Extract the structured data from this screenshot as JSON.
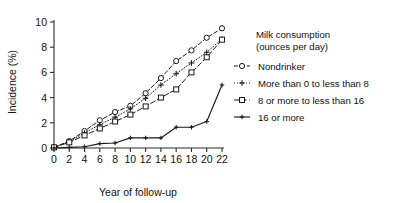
{
  "chart_data": {
    "type": "line",
    "title": "",
    "xlabel": "Year of follow-up",
    "ylabel": "Incidence (%)",
    "xlim": [
      0,
      22
    ],
    "ylim": [
      0,
      10
    ],
    "xticks": [
      0,
      2,
      4,
      6,
      8,
      10,
      12,
      14,
      16,
      18,
      20,
      22
    ],
    "yticks": [
      0,
      2,
      4,
      6,
      8,
      10
    ],
    "grid": false,
    "legend_position": "right",
    "legend_title_line1": "Milk consumption",
    "legend_title_line2": "(ounces per day)",
    "x": [
      0,
      2,
      4,
      6,
      8,
      10,
      12,
      14,
      16,
      18,
      20,
      22
    ],
    "series": [
      {
        "name": "Nondrinker",
        "values": [
          0.05,
          0.55,
          1.35,
          2.2,
          2.85,
          3.35,
          4.35,
          5.55,
          6.9,
          7.75,
          8.75,
          9.5
        ],
        "dash": "4,2.4",
        "marker": "circle-open",
        "color": "#1a1a1a",
        "width": 1.0
      },
      {
        "name": "More than 0 to less than 8",
        "values": [
          0.05,
          0.5,
          1.2,
          1.85,
          2.45,
          3.1,
          3.95,
          5.0,
          5.9,
          6.75,
          7.6,
          8.65
        ],
        "dash": "1,2",
        "marker": "plus",
        "color": "#1a1a1a",
        "width": 1.0
      },
      {
        "name": "8 or more to less than 16",
        "values": [
          0.05,
          0.45,
          1.0,
          1.55,
          2.1,
          2.65,
          3.3,
          4.0,
          4.65,
          6.0,
          7.2,
          8.6
        ],
        "dash": "5,2.6",
        "marker": "square-open",
        "color": "#1a1a1a",
        "width": 1.0
      },
      {
        "name": "16 or more",
        "values": [
          0.0,
          0.05,
          0.1,
          0.35,
          0.4,
          0.8,
          0.8,
          0.8,
          1.65,
          1.65,
          2.1,
          5.0
        ],
        "dash": "none",
        "marker": "plus-small",
        "color": "#1a1a1a",
        "width": 1.15
      }
    ]
  }
}
